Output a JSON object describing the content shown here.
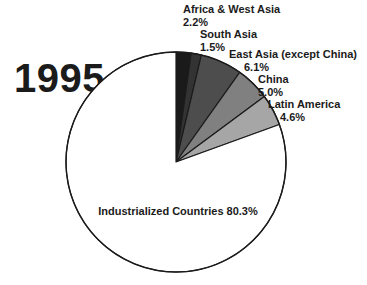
{
  "year_caption": "1995",
  "chart_data": {
    "type": "pie",
    "title": "1995",
    "xlabel": "",
    "ylabel": "",
    "legend_position": "callout-labels",
    "grid": false,
    "start_angle_deg": 0,
    "direction": "clockwise",
    "units": "percent",
    "categories": [
      "Africa & West Asia",
      "South Asia",
      "East Asia (except China)",
      "China",
      "Latin America",
      "Industrialized Countries"
    ],
    "values": [
      2.2,
      1.5,
      6.1,
      5.0,
      4.6,
      80.3
    ],
    "value_labels": [
      "2.2%",
      "1.5%",
      "6.1%",
      "5.0%",
      "4.6%",
      "80.3%"
    ],
    "colors": [
      "#1a1a1a",
      "#333333",
      "#4d4d4d",
      "#808080",
      "#a6a6a6",
      "#ffffff"
    ],
    "slice_outline_color": "#1b1b1b",
    "slices": [
      {
        "label": "Africa & West Asia",
        "percent_label": "2.2%",
        "value": 2.2,
        "color": "#1a1a1a"
      },
      {
        "label": "South Asia",
        "percent_label": "1.5%",
        "value": 1.5,
        "color": "#333333"
      },
      {
        "label": "East Asia (except China)",
        "percent_label": "6.1%",
        "value": 6.1,
        "color": "#4d4d4d"
      },
      {
        "label": "China",
        "percent_label": "5.0%",
        "value": 5.0,
        "color": "#808080"
      },
      {
        "label": "Latin America",
        "percent_label": "4.6%",
        "value": 4.6,
        "color": "#a6a6a6"
      },
      {
        "label": "Industrialized Countries",
        "percent_label": "80.3%",
        "value": 80.3,
        "color": "#ffffff"
      }
    ]
  }
}
